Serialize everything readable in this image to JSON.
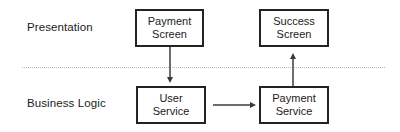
{
  "diagram": {
    "type": "layered-architecture",
    "background_color": "#ffffff",
    "box_border_color": "#232323",
    "text_color": "#1b1b1b",
    "divider_color": "#b9b9b9",
    "arrow_color": "#6d6d6d",
    "lanes": [
      {
        "id": "presentation",
        "label": "Presentation"
      },
      {
        "id": "business-logic",
        "label": "Business Logic"
      }
    ],
    "divider": {
      "style": "dotted"
    },
    "nodes": [
      {
        "id": "payment-screen",
        "lane": "presentation",
        "line1": "Payment",
        "line2": "Screen"
      },
      {
        "id": "success-screen",
        "lane": "presentation",
        "line1": "Success",
        "line2": "Screen"
      },
      {
        "id": "user-service",
        "lane": "business-logic",
        "line1": "User",
        "line2": "Service"
      },
      {
        "id": "payment-service",
        "lane": "business-logic",
        "line1": "Payment",
        "line2": "Service"
      }
    ],
    "edges": [
      {
        "id": "payment-screen-to-user-service",
        "from": "payment-screen",
        "to": "user-service",
        "direction": "down",
        "label": ""
      },
      {
        "id": "payment-service-to-success-screen",
        "from": "payment-service",
        "to": "success-screen",
        "direction": "up",
        "label": ""
      },
      {
        "id": "user-service-to-payment-service",
        "from": "user-service",
        "to": "payment-service",
        "direction": "right",
        "label": ""
      }
    ]
  }
}
